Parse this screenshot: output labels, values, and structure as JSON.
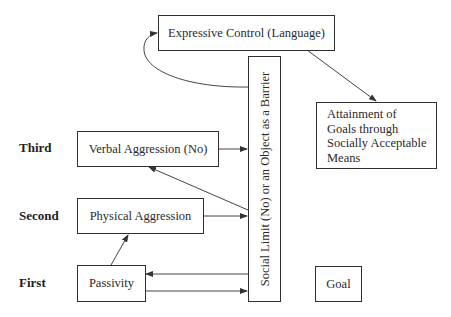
{
  "diagram": {
    "type": "flow",
    "row_labels": [
      "Third",
      "Second",
      "First"
    ],
    "boxes": {
      "expressive_control": "Expressive Control (Language)",
      "barrier": "Social Limit (No) or an Object as a Barrier",
      "verbal_aggression": "Verbal Aggression (No)",
      "physical_aggression": "Physical Aggression",
      "passivity": "Passivity",
      "attainment": [
        "Attainment of",
        "Goals through",
        "Socially Acceptable",
        "Means"
      ],
      "goal": "Goal"
    },
    "edges": [
      {
        "from": "barrier",
        "to": "expressive_control",
        "style": "curved"
      },
      {
        "from": "expressive_control",
        "to": "attainment"
      },
      {
        "from": "verbal_aggression",
        "to": "barrier"
      },
      {
        "from": "barrier",
        "to": "verbal_aggression"
      },
      {
        "from": "physical_aggression",
        "to": "barrier"
      },
      {
        "from": "passivity",
        "to": "physical_aggression"
      },
      {
        "from": "barrier",
        "to": "passivity"
      },
      {
        "from": "passivity",
        "to": "barrier"
      }
    ],
    "colors": {
      "line": "#2f2f2f",
      "background": "#ffffff"
    }
  }
}
